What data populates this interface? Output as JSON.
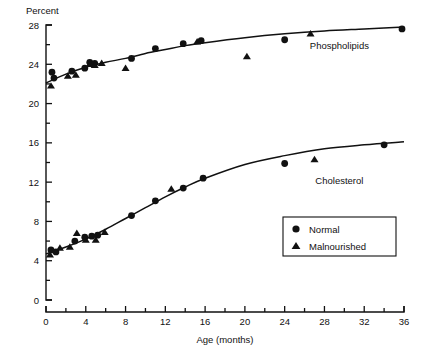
{
  "chart_data": {
    "type": "scatter",
    "title": "",
    "xlabel": "Age  (months)",
    "ylabel": "Percent",
    "xlim": [
      0,
      36
    ],
    "ylim": [
      0,
      28
    ],
    "grid": false,
    "x_ticks": [
      0,
      4,
      8,
      12,
      16,
      20,
      24,
      28,
      32,
      36
    ],
    "x_minor_ticks": [
      2,
      6,
      10,
      14,
      18,
      22,
      26,
      30,
      34
    ],
    "y_ticks": [
      0,
      4,
      8,
      12,
      16,
      20,
      24,
      28
    ],
    "y_minor_ticks": [
      2,
      6,
      10,
      14,
      18,
      22,
      26
    ],
    "legend_position": "lower-right",
    "annotations": [
      {
        "text": "Phospholipids",
        "x": 29.5,
        "y": 25.6
      },
      {
        "text": "Cholesterol",
        "x": 29.5,
        "y": 11.8
      }
    ],
    "series": [
      {
        "name": "Normal",
        "marker": "circle",
        "color": "#111111",
        "points": [
          {
            "x": 0.6,
            "y": 23.2,
            "group": "Phospholipids"
          },
          {
            "x": 0.8,
            "y": 22.6,
            "group": "Phospholipids"
          },
          {
            "x": 2.6,
            "y": 23.3,
            "group": "Phospholipids"
          },
          {
            "x": 3.9,
            "y": 23.6,
            "group": "Phospholipids"
          },
          {
            "x": 4.4,
            "y": 24.2,
            "group": "Phospholipids"
          },
          {
            "x": 4.9,
            "y": 24.1,
            "group": "Phospholipids"
          },
          {
            "x": 8.6,
            "y": 24.6,
            "group": "Phospholipids"
          },
          {
            "x": 11.0,
            "y": 25.6,
            "group": "Phospholipids"
          },
          {
            "x": 13.8,
            "y": 26.1,
            "group": "Phospholipids"
          },
          {
            "x": 15.6,
            "y": 26.4,
            "group": "Phospholipids"
          },
          {
            "x": 24.0,
            "y": 26.5,
            "group": "Phospholipids"
          },
          {
            "x": 35.8,
            "y": 27.6,
            "group": "Phospholipids"
          },
          {
            "x": 0.5,
            "y": 5.1,
            "group": "Cholesterol"
          },
          {
            "x": 1.0,
            "y": 4.9,
            "group": "Cholesterol"
          },
          {
            "x": 2.9,
            "y": 6.0,
            "group": "Cholesterol"
          },
          {
            "x": 3.9,
            "y": 6.4,
            "group": "Cholesterol"
          },
          {
            "x": 4.6,
            "y": 6.5,
            "group": "Cholesterol"
          },
          {
            "x": 5.2,
            "y": 6.6,
            "group": "Cholesterol"
          },
          {
            "x": 8.6,
            "y": 8.6,
            "group": "Cholesterol"
          },
          {
            "x": 11.0,
            "y": 10.1,
            "group": "Cholesterol"
          },
          {
            "x": 13.8,
            "y": 11.4,
            "group": "Cholesterol"
          },
          {
            "x": 15.8,
            "y": 12.4,
            "group": "Cholesterol"
          },
          {
            "x": 24.0,
            "y": 13.9,
            "group": "Cholesterol"
          },
          {
            "x": 34.0,
            "y": 15.8,
            "group": "Cholesterol"
          }
        ]
      },
      {
        "name": "Malnourished",
        "marker": "triangle",
        "color": "#111111",
        "points": [
          {
            "x": 0.5,
            "y": 21.8,
            "group": "Phospholipids"
          },
          {
            "x": 2.2,
            "y": 22.8,
            "group": "Phospholipids"
          },
          {
            "x": 3.0,
            "y": 22.9,
            "group": "Phospholipids"
          },
          {
            "x": 4.4,
            "y": 24.0,
            "group": "Phospholipids"
          },
          {
            "x": 4.9,
            "y": 23.9,
            "group": "Phospholipids"
          },
          {
            "x": 5.6,
            "y": 24.1,
            "group": "Phospholipids"
          },
          {
            "x": 8.0,
            "y": 23.6,
            "group": "Phospholipids"
          },
          {
            "x": 15.2,
            "y": 26.3,
            "group": "Phospholipids"
          },
          {
            "x": 20.2,
            "y": 24.8,
            "group": "Phospholipids"
          },
          {
            "x": 26.6,
            "y": 27.1,
            "group": "Phospholipids"
          },
          {
            "x": 0.4,
            "y": 4.6,
            "group": "Cholesterol"
          },
          {
            "x": 1.4,
            "y": 5.3,
            "group": "Cholesterol"
          },
          {
            "x": 2.4,
            "y": 5.4,
            "group": "Cholesterol"
          },
          {
            "x": 3.1,
            "y": 6.8,
            "group": "Cholesterol"
          },
          {
            "x": 4.0,
            "y": 6.1,
            "group": "Cholesterol"
          },
          {
            "x": 5.0,
            "y": 6.1,
            "group": "Cholesterol"
          },
          {
            "x": 5.9,
            "y": 6.9,
            "group": "Cholesterol"
          },
          {
            "x": 12.6,
            "y": 11.3,
            "group": "Cholesterol"
          },
          {
            "x": 27.0,
            "y": 14.3,
            "group": "Cholesterol"
          }
        ]
      }
    ],
    "fit_curves": [
      {
        "name": "Phospholipids",
        "points": [
          {
            "x": 0.0,
            "y": 22.1
          },
          {
            "x": 2.0,
            "y": 23.0
          },
          {
            "x": 4.0,
            "y": 23.7
          },
          {
            "x": 6.0,
            "y": 24.2
          },
          {
            "x": 8.0,
            "y": 24.6
          },
          {
            "x": 10.0,
            "y": 25.1
          },
          {
            "x": 12.0,
            "y": 25.5
          },
          {
            "x": 14.0,
            "y": 25.9
          },
          {
            "x": 16.0,
            "y": 26.2
          },
          {
            "x": 20.0,
            "y": 26.7
          },
          {
            "x": 24.0,
            "y": 27.1
          },
          {
            "x": 28.0,
            "y": 27.4
          },
          {
            "x": 32.0,
            "y": 27.6
          },
          {
            "x": 36.0,
            "y": 27.8
          }
        ]
      },
      {
        "name": "Cholesterol",
        "points": [
          {
            "x": 0.0,
            "y": 4.7
          },
          {
            "x": 2.0,
            "y": 5.4
          },
          {
            "x": 4.0,
            "y": 6.2
          },
          {
            "x": 6.0,
            "y": 7.2
          },
          {
            "x": 8.0,
            "y": 8.3
          },
          {
            "x": 10.0,
            "y": 9.4
          },
          {
            "x": 12.0,
            "y": 10.5
          },
          {
            "x": 14.0,
            "y": 11.5
          },
          {
            "x": 16.0,
            "y": 12.4
          },
          {
            "x": 20.0,
            "y": 13.8
          },
          {
            "x": 24.0,
            "y": 14.7
          },
          {
            "x": 28.0,
            "y": 15.4
          },
          {
            "x": 32.0,
            "y": 15.8
          },
          {
            "x": 36.0,
            "y": 16.1
          }
        ]
      }
    ],
    "legend": [
      {
        "label": "Normal",
        "marker": "circle"
      },
      {
        "label": "Malnourished",
        "marker": "triangle"
      }
    ]
  }
}
